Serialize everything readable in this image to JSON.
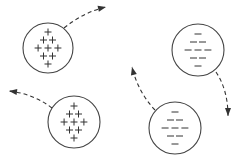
{
  "diagram": {
    "colors": {
      "stroke": "#444444",
      "background": "#ffffff"
    },
    "spheres": [
      {
        "id": "A",
        "charge": "positive",
        "symbol": "+",
        "cx": 48,
        "cy": 48,
        "r": 25,
        "rows": [
          1,
          2,
          3,
          2,
          1
        ],
        "arrow": {
          "from": [
            64,
            28
          ],
          "ctrl": [
            84,
            12
          ],
          "to": [
            106,
            7
          ]
        }
      },
      {
        "id": "B",
        "charge": "negative",
        "symbol": "−",
        "cx": 198,
        "cy": 50,
        "r": 26,
        "rows": [
          1,
          2,
          3,
          2,
          1
        ],
        "arrow": {
          "from": [
            216,
            72
          ],
          "ctrl": [
            228,
            90
          ],
          "to": [
            228,
            116
          ]
        }
      },
      {
        "id": "C",
        "charge": "positive",
        "symbol": "+",
        "cx": 74,
        "cy": 122,
        "r": 26,
        "rows": [
          1,
          2,
          3,
          2,
          1
        ],
        "arrow": {
          "from": [
            52,
            108
          ],
          "ctrl": [
            34,
            94
          ],
          "to": [
            9,
            91
          ]
        }
      },
      {
        "id": "D",
        "charge": "negative",
        "symbol": "−",
        "cx": 175,
        "cy": 128,
        "r": 26,
        "rows": [
          1,
          2,
          3,
          2,
          1
        ],
        "arrow": {
          "from": [
            155,
            110
          ],
          "ctrl": [
            138,
            92
          ],
          "to": [
            132,
            67
          ]
        }
      }
    ]
  }
}
